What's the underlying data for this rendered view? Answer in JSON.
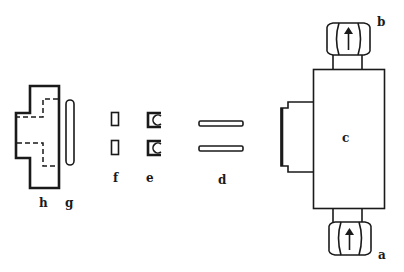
{
  "diagram": {
    "parts": [
      {
        "id": "h",
        "label": "h",
        "shape": "stepped-block-with-hidden-bore"
      },
      {
        "id": "g",
        "label": "g",
        "shape": "rod"
      },
      {
        "id": "f",
        "label": "f",
        "shape": "small-rectangles-pair"
      },
      {
        "id": "e",
        "label": "e",
        "shape": "clips-pair"
      },
      {
        "id": "d",
        "label": "d",
        "shape": "bars-pair"
      },
      {
        "id": "c",
        "label": "c",
        "shape": "body-with-flange"
      },
      {
        "id": "b",
        "label": "b",
        "shape": "hex-nut-top"
      },
      {
        "id": "a",
        "label": "a",
        "shape": "hex-nut-bottom"
      }
    ],
    "colors": {
      "ink": "#1a1a1a",
      "background": "#ffffff"
    }
  }
}
